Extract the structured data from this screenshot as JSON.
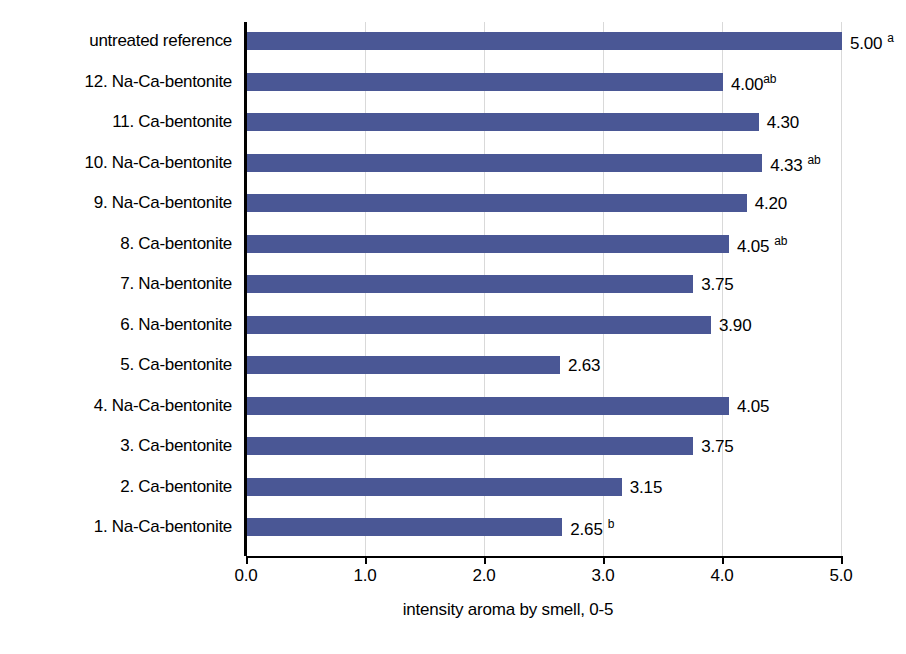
{
  "chart_data": {
    "type": "bar",
    "orientation": "horizontal",
    "title": "",
    "xlabel": "intensity aroma by smell, 0-5",
    "ylabel": "",
    "xlim": [
      0.0,
      5.0
    ],
    "xticks": [
      "0.0",
      "1.0",
      "2.0",
      "3.0",
      "4.0",
      "5.0"
    ],
    "xtick_values": [
      0.0,
      1.0,
      2.0,
      3.0,
      4.0,
      5.0
    ],
    "grid": "vertical",
    "legend": "none",
    "bar_color": "#4a5795",
    "categories": [
      "untreated reference",
      "12. Na-Ca-bentonite",
      "11. Ca-bentonite",
      "10. Na-Ca-bentonite",
      "9. Na-Ca-bentonite",
      "8. Ca-bentonite",
      "7. Na-bentonite",
      "6. Na-bentonite",
      "5. Ca-bentonite",
      "4. Na-Ca-bentonite",
      "3. Ca-bentonite",
      "2. Ca-bentonite",
      "1. Na-Ca-bentonite"
    ],
    "values": [
      5.0,
      4.0,
      4.3,
      4.33,
      4.2,
      4.05,
      3.75,
      3.9,
      2.63,
      4.05,
      3.75,
      3.15,
      2.65
    ],
    "value_labels": [
      "5.00",
      "4.00",
      "4.30",
      "4.33",
      "4.20",
      "4.05",
      "3.75",
      "3.90",
      "2.63",
      "4.05",
      "3.75",
      "3.15",
      "2.65"
    ],
    "significance_marks": [
      "a",
      "ab",
      "",
      "ab",
      "",
      "ab",
      "",
      "",
      "",
      "",
      "",
      "",
      "b"
    ],
    "mark_spacing": [
      true,
      false,
      false,
      true,
      false,
      true,
      false,
      false,
      false,
      false,
      false,
      false,
      true
    ]
  }
}
